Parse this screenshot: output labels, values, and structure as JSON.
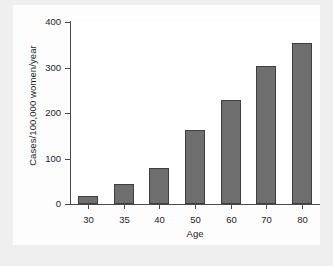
{
  "figure": {
    "background_color": "#efefef",
    "panel_color": "#fdfdfd"
  },
  "chart_data": {
    "type": "bar",
    "title": "",
    "subtitle": "",
    "xlabel": "Age",
    "ylabel": "Cases/100,000 women/year",
    "categories": [
      "30",
      "35",
      "40",
      "50",
      "60",
      "70",
      "80"
    ],
    "values": [
      18,
      44,
      80,
      163,
      229,
      303,
      353
    ],
    "series": [
      {
        "name": "Incidence",
        "values": [
          18,
          44,
          80,
          163,
          229,
          303,
          353
        ]
      }
    ],
    "ylim": [
      0,
      400
    ],
    "yticks": [
      0,
      100,
      200,
      300,
      400
    ],
    "ytick_labels": [
      "0",
      "100",
      "200",
      "300",
      "400"
    ],
    "xtick_labels": [
      "30",
      "35",
      "40",
      "50",
      "60",
      "70",
      "80"
    ],
    "grid": false,
    "legend": null,
    "legend_position": "none",
    "annotations": [],
    "bar_color": "#6e6e6e",
    "bar_edge_color": "#3e3e3e",
    "axis_color": "#4a4a4a",
    "text_color": "#1c1c1c"
  }
}
